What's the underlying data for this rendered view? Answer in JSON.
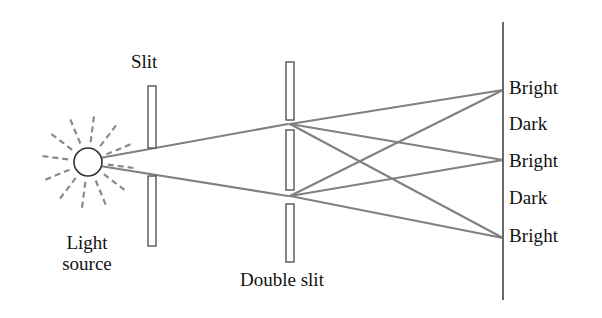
{
  "figure": {
    "background_color": "#ffffff",
    "ray_color": "#808080",
    "barrier_color": "#555555",
    "text_color": "#111111"
  },
  "labels": {
    "slit": "Slit",
    "double_slit": "Double slit",
    "light_source_line1": "Light",
    "light_source_line2": "source"
  },
  "screen_labels": [
    {
      "text": "Bright",
      "y": 90
    },
    {
      "text": "Dark",
      "y": 126
    },
    {
      "text": "Bright",
      "y": 163
    },
    {
      "text": "Dark",
      "y": 200
    },
    {
      "text": "Bright",
      "y": 238
    }
  ],
  "components": {
    "light_source": {
      "name": "light-source",
      "cx": 88,
      "cy": 162,
      "r": 14,
      "ray_count": 12,
      "ray_inner": 20,
      "ray_outer": 50
    },
    "single_slit": {
      "name": "single-slit",
      "x": 148,
      "width": 8,
      "upper_bar": {
        "y": 86,
        "height": 62
      },
      "lower_bar": {
        "y": 176,
        "height": 70
      }
    },
    "double_slit": {
      "name": "double-slit",
      "x": 286,
      "width": 8,
      "bars": [
        {
          "y": 62,
          "height": 58
        },
        {
          "y": 130,
          "height": 60
        },
        {
          "y": 204,
          "height": 58
        }
      ],
      "gap_upper_y": 124,
      "gap_lower_y": 196
    },
    "screen": {
      "name": "observation-screen",
      "x": 503,
      "y_top": 22,
      "y_bottom": 300
    }
  },
  "chart_data": {
    "type": "diagram",
    "source_rays_through_slit": [
      {
        "from": [
          100,
          158
        ],
        "to": [
          288,
          124
        ]
      },
      {
        "from": [
          100,
          166
        ],
        "to": [
          288,
          196
        ]
      }
    ],
    "interference_rays": [
      {
        "from": [
          290,
          124
        ],
        "to": [
          503,
          90
        ]
      },
      {
        "from": [
          290,
          124
        ],
        "to": [
          503,
          160
        ]
      },
      {
        "from": [
          290,
          124
        ],
        "to": [
          503,
          238
        ]
      },
      {
        "from": [
          290,
          196
        ],
        "to": [
          503,
          90
        ]
      },
      {
        "from": [
          290,
          196
        ],
        "to": [
          503,
          160
        ]
      },
      {
        "from": [
          290,
          196
        ],
        "to": [
          503,
          238
        ]
      }
    ]
  }
}
